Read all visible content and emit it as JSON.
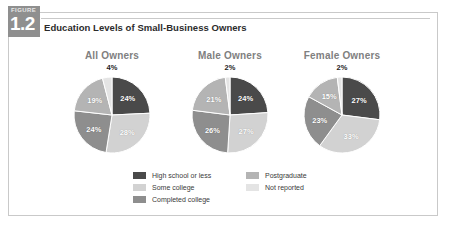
{
  "figure": {
    "tab_word": "FIGURE",
    "tab_number": "1.2",
    "title": "Education Levels of Small-Business Owners"
  },
  "legend": {
    "left_column": [
      {
        "label": "High school or less",
        "color": "#4a4a4a"
      },
      {
        "label": "Some college",
        "color": "#d2d2d2"
      },
      {
        "label": "Completed college",
        "color": "#8e8e8e"
      }
    ],
    "right_column": [
      {
        "label": "Postgraduate",
        "color": "#b4b4b4"
      },
      {
        "label": "Not reported",
        "color": "#e4e4e4"
      }
    ]
  },
  "chart_data": {
    "type": "pie",
    "title": "Education Levels of Small-Business Owners",
    "legend_position": "bottom",
    "categories": [
      "High school or less",
      "Some college",
      "Completed college",
      "Postgraduate",
      "Not reported"
    ],
    "colors": [
      "#4a4a4a",
      "#d2d2d2",
      "#8e8e8e",
      "#b4b4b4",
      "#e4e4e4"
    ],
    "unit": "%",
    "charts": [
      {
        "name": "All Owners",
        "top_label": "4%",
        "values": [
          24,
          28,
          24,
          19,
          4
        ],
        "labels": [
          "24%",
          "28%",
          "24%",
          "19%",
          "4%"
        ]
      },
      {
        "name": "Male Owners",
        "top_label": "2%",
        "values": [
          24,
          27,
          26,
          21,
          2
        ],
        "labels": [
          "24%",
          "27%",
          "26%",
          "21%",
          "2%"
        ]
      },
      {
        "name": "Female Owners",
        "top_label": "2%",
        "values": [
          27,
          33,
          23,
          15,
          2
        ],
        "labels": [
          "27%",
          "33%",
          "23%",
          "15%",
          "2%"
        ]
      }
    ]
  }
}
